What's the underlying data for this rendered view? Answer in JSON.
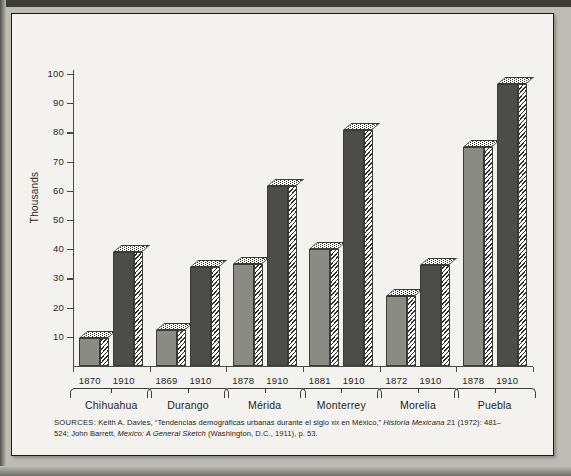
{
  "figure": {
    "y_axis_title": "Thousands",
    "source_note": {
      "lead": "SOURCES:",
      "line1_a": " Keith A. Davies, “Tendencias demográficas urbanas durante el siglo ",
      "line1_smallcaps": "xix",
      "line1_b": " en México,” ",
      "line1_italic": "Historia",
      "line2_italic_a": "Mexicana",
      "line2_b": " 21 (1972): 481–524; John Barrett, ",
      "line2_italic_b": "Mexico: A General Sketch",
      "line2_c": " (Washington, D.C., 1911), p. 53."
    }
  },
  "chart_data": {
    "type": "bar",
    "title": "",
    "xlabel": "",
    "ylabel": "Thousands",
    "ylim": [
      0,
      100
    ],
    "yticks": [
      10,
      20,
      30,
      40,
      50,
      60,
      70,
      80,
      90,
      100
    ],
    "ytick_labels": [
      "10",
      "20",
      "30",
      "40",
      "50",
      "60",
      "70",
      "80",
      "90",
      "100"
    ],
    "grid": false,
    "legend": "none",
    "categories": [
      "Chihuahua",
      "Durango",
      "Mérida",
      "Monterrey",
      "Morelia",
      "Puebla"
    ],
    "groups": [
      {
        "city": "Chihuahua",
        "bars": [
          {
            "year": "1870",
            "value": 9.5,
            "shade": "light"
          },
          {
            "year": "1910",
            "value": 39.0,
            "shade": "dark"
          }
        ]
      },
      {
        "city": "Durango",
        "bars": [
          {
            "year": "1869",
            "value": 12.5,
            "shade": "light"
          },
          {
            "year": "1910",
            "value": 34.0,
            "shade": "dark"
          }
        ]
      },
      {
        "city": "Mérida",
        "bars": [
          {
            "year": "1878",
            "value": 35.0,
            "shade": "light"
          },
          {
            "year": "1910",
            "value": 61.5,
            "shade": "dark"
          }
        ]
      },
      {
        "city": "Monterrey",
        "bars": [
          {
            "year": "1881",
            "value": 40.0,
            "shade": "light"
          },
          {
            "year": "1910",
            "value": 81.0,
            "shade": "dark"
          }
        ]
      },
      {
        "city": "Morelia",
        "bars": [
          {
            "year": "1872",
            "value": 24.0,
            "shade": "light"
          },
          {
            "year": "1910",
            "value": 34.5,
            "shade": "dark"
          }
        ]
      },
      {
        "city": "Puebla",
        "bars": [
          {
            "year": "1878",
            "value": 75.0,
            "shade": "light"
          },
          {
            "year": "1910",
            "value": 96.5,
            "shade": "dark"
          }
        ]
      }
    ],
    "colors": {
      "light_bar": "#8b8b85",
      "dark_bar": "#4c4c49",
      "axis": "#4a4a46",
      "text": "#1f1f1d",
      "page": "#f3f2ee"
    }
  }
}
